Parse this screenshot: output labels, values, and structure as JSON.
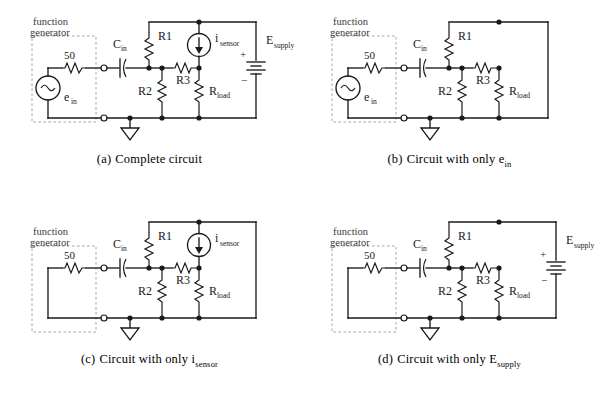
{
  "figure": {
    "panel_count": 4,
    "background_color": "#ffffff",
    "line_color": "#1a1a1a",
    "dashed_box_color": "#9a9a9a"
  },
  "labels": {
    "function_generator_line1": "function",
    "function_generator_line2": "generator",
    "source_impedance": "50",
    "ein_base": "e",
    "ein_sub": "in",
    "cin_base": "C",
    "cin_sub": "in",
    "r1": "R1",
    "r2": "R2",
    "r3": "R3",
    "rload_base": "R",
    "rload_sub": "load",
    "isensor_base": "i",
    "isensor_sub": "sensor",
    "esupply_base": "E",
    "esupply_sub": "supply",
    "plus_sign": "+",
    "minus_sign": "−"
  },
  "panels": [
    {
      "id": "a",
      "index_label": "(a)",
      "caption_text": "Complete circuit",
      "caption_sub": "",
      "sources_present": {
        "e_in": true,
        "i_sensor": true,
        "E_supply": true
      },
      "e_in_state": "active",
      "i_sensor_state": "active",
      "E_supply_state": "active"
    },
    {
      "id": "b",
      "index_label": "(b)",
      "caption_text": "Circuit with only e",
      "caption_sub": "in",
      "sources_present": {
        "e_in": true,
        "i_sensor": false,
        "E_supply": false
      },
      "e_in_state": "active",
      "i_sensor_state": "open",
      "E_supply_state": "shorted"
    },
    {
      "id": "c",
      "index_label": "(c)",
      "caption_text": "Circuit with only i",
      "caption_sub": "sensor",
      "sources_present": {
        "e_in": false,
        "i_sensor": true,
        "E_supply": false
      },
      "e_in_state": "shorted",
      "i_sensor_state": "active",
      "E_supply_state": "shorted"
    },
    {
      "id": "d",
      "index_label": "(d)",
      "caption_text": "Circuit with only E",
      "caption_sub": "supply",
      "sources_present": {
        "e_in": false,
        "i_sensor": false,
        "E_supply": true
      },
      "e_in_state": "shorted",
      "i_sensor_state": "open",
      "E_supply_state": "active"
    }
  ],
  "components": [
    {
      "name": "source-resistance-50",
      "label": "50",
      "type": "resistor",
      "orientation": "horizontal"
    },
    {
      "name": "ein-source",
      "label": "e_in",
      "type": "ac-voltage-source"
    },
    {
      "name": "cin-capacitor",
      "label": "C_in",
      "type": "capacitor",
      "style": "polarized"
    },
    {
      "name": "r1-resistor",
      "label": "R1",
      "type": "resistor",
      "orientation": "vertical"
    },
    {
      "name": "r2-resistor",
      "label": "R2",
      "type": "resistor",
      "orientation": "vertical"
    },
    {
      "name": "r3-resistor",
      "label": "R3",
      "type": "resistor",
      "orientation": "horizontal"
    },
    {
      "name": "rload-resistor",
      "label": "R_load",
      "type": "resistor",
      "orientation": "vertical"
    },
    {
      "name": "isensor-source",
      "label": "i_sensor",
      "type": "current-source",
      "arrow_direction": "down"
    },
    {
      "name": "esupply-battery",
      "label": "E_supply",
      "type": "battery",
      "polarity_top": "+",
      "polarity_bottom": "−"
    },
    {
      "name": "ground-symbol",
      "label": "",
      "type": "ground"
    }
  ]
}
